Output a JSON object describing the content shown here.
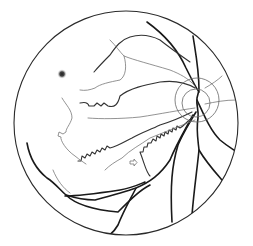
{
  "figure": {
    "colors": {
      "background": "#ffffff",
      "vessel_major": "#1a1a1a",
      "vessel_minor": "#777777",
      "border": "#2a2a2a"
    },
    "elements": [
      {
        "name": "fundus-boundary",
        "shape": "circle"
      },
      {
        "name": "optic-disc",
        "shape": "concentric-circles"
      },
      {
        "name": "macular-spot",
        "shape": "dark-blurred-dot"
      },
      {
        "name": "arrow-marker",
        "shape": "small-right-arrow"
      },
      {
        "name": "blood-vessels",
        "shape": "branching-lines"
      }
    ]
  }
}
